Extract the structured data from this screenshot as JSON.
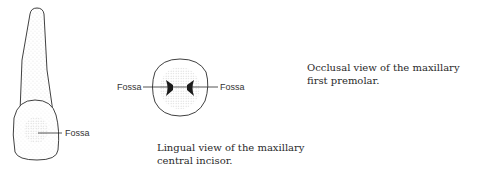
{
  "figures": {
    "incisor": {
      "fossa_label": "Fossa",
      "caption_line1": "Lingual view of the maxillary",
      "caption_line2": "central incisor."
    },
    "premolar": {
      "fossa_label_left": "Fossa",
      "fossa_label_right": "Fossa",
      "caption_line1": "Occlusal view of the maxillary",
      "caption_line2": "first premolar."
    }
  },
  "colors": {
    "outline": "#2a2a2a",
    "stipple": "#8a8a8a",
    "fossa_dark": "#1a1a1a"
  }
}
